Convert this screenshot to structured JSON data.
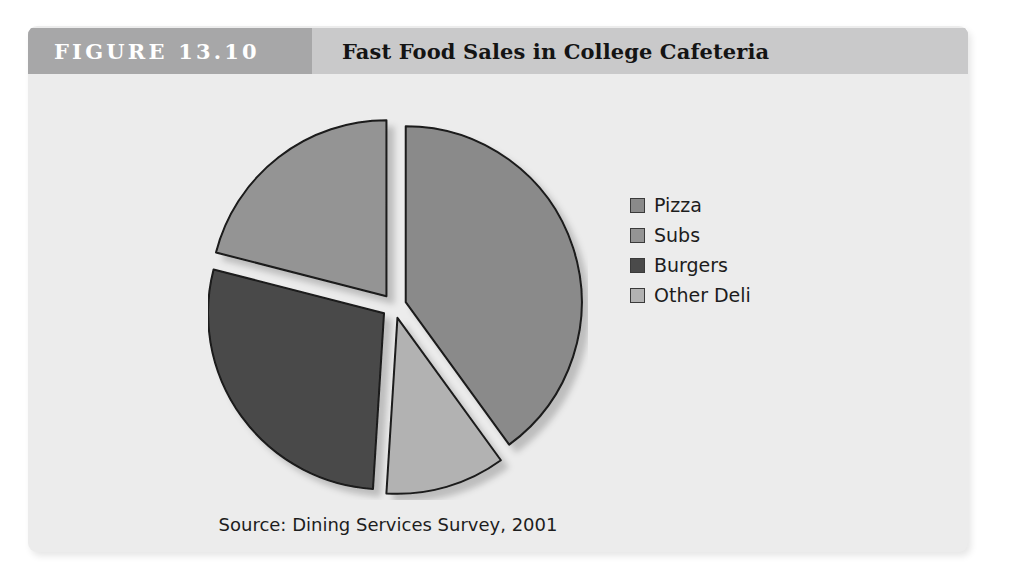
{
  "figure": {
    "number_label": "FIGURE 13.10",
    "title": "Fast Food Sales in College Cafeteria",
    "source_note": "Source: Dining Services Survey, 2001"
  },
  "colors": {
    "page_background": "#ffffff",
    "panel_background": "#ececec",
    "header_band": "#c9c9ca",
    "header_number_block": "#a7a7a8",
    "header_number_text": "#ffffff",
    "title_text": "#141414",
    "body_text": "#1d1d1d",
    "slice_outline": "#1a1a1a",
    "shadow": "rgba(0,0,0,0.22)"
  },
  "chart_data": {
    "type": "pie",
    "title": "Fast Food Sales in College Cafeteria",
    "subtitle": "",
    "xlabel": "",
    "ylabel": "",
    "legend_position": "right",
    "grid": false,
    "exploded": true,
    "start_angle_deg": 0,
    "direction": "clockwise",
    "categories": [
      "Pizza",
      "Subs",
      "Burgers",
      "Other Deli"
    ],
    "values": [
      40,
      21,
      28,
      11
    ],
    "unit": "percent",
    "slices": [
      {
        "label": "Pizza",
        "value": 40,
        "color": "#8a8a8a",
        "start_deg": 0,
        "end_deg": 144,
        "explode": 0.07
      },
      {
        "label": "Other Deli",
        "value": 11,
        "color": "#b2b2b2",
        "start_deg": 144,
        "end_deg": 183.6,
        "explode": 0.07
      },
      {
        "label": "Burgers",
        "value": 28,
        "color": "#4a4a4a",
        "start_deg": 183.6,
        "end_deg": 284.4,
        "explode": 0.07
      },
      {
        "label": "Subs",
        "value": 21,
        "color": "#949494",
        "start_deg": 284.4,
        "end_deg": 360,
        "explode": 0.07
      }
    ],
    "annotations": [
      "Source: Dining Services Survey, 2001"
    ]
  },
  "legend": {
    "items": [
      {
        "label": "Pizza",
        "color": "#8a8a8a"
      },
      {
        "label": "Subs",
        "color": "#949494"
      },
      {
        "label": "Burgers",
        "color": "#4a4a4a"
      },
      {
        "label": "Other Deli",
        "color": "#b2b2b2"
      }
    ]
  }
}
